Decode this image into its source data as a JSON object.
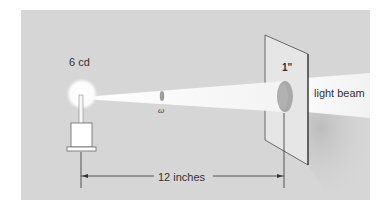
{
  "figure": {
    "type": "illumination-diagram",
    "labels": {
      "source_intensity": "6 cd",
      "solid_angle": "ω",
      "aperture_diameter": "1\"",
      "beam": "light beam",
      "distance": "12 inches"
    },
    "colors": {
      "background": "#d6d6d6",
      "beam": "#f4f4f4",
      "screen": "#e4e4e4",
      "aperture": "#a8a8a8",
      "line": "#333333"
    }
  }
}
